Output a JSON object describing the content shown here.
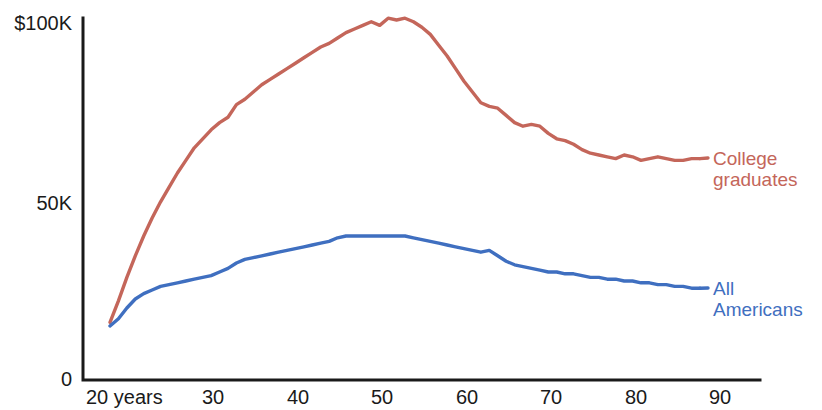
{
  "chart_data": {
    "type": "line",
    "title": "",
    "subtitle": "",
    "xlabel": "",
    "ylabel": "",
    "xlim": [
      20,
      90
    ],
    "ylim": [
      0,
      100000
    ],
    "grid": false,
    "legend_position": "right-inline",
    "x_tick_labels": [
      "20 years",
      "30",
      "40",
      "50",
      "60",
      "70",
      "80",
      "90"
    ],
    "x_tick_values": [
      20,
      30,
      40,
      50,
      60,
      70,
      80,
      90
    ],
    "y_tick_labels": [
      "$100K",
      "50K",
      "0"
    ],
    "y_tick_values": [
      100000,
      50000,
      0
    ],
    "x": [
      20,
      21,
      22,
      23,
      24,
      25,
      26,
      27,
      28,
      29,
      30,
      31,
      32,
      33,
      34,
      35,
      36,
      37,
      38,
      39,
      40,
      41,
      42,
      43,
      44,
      45,
      46,
      47,
      48,
      49,
      50,
      51,
      52,
      53,
      54,
      55,
      56,
      57,
      58,
      59,
      60,
      61,
      62,
      63,
      64,
      65,
      66,
      67,
      68,
      69,
      70,
      71,
      72,
      73,
      74,
      75,
      76,
      77,
      78,
      79,
      80,
      81,
      82,
      83,
      84,
      85,
      86,
      87,
      88,
      89,
      90
    ],
    "series": [
      {
        "name": "College graduates",
        "color": "#c4665a",
        "label_line1": "College",
        "label_line2": "graduates",
        "values": [
          16000,
          22000,
          28500,
          34500,
          40000,
          45000,
          49500,
          53500,
          57500,
          61000,
          64500,
          67000,
          69500,
          71500,
          73000,
          76500,
          78000,
          80000,
          82000,
          83500,
          85000,
          86500,
          88000,
          89500,
          91000,
          92500,
          93500,
          95000,
          96500,
          97500,
          98500,
          99500,
          98500,
          100500,
          100000,
          100500,
          99500,
          98000,
          96000,
          93000,
          90000,
          86500,
          83000,
          80000,
          77000,
          76000,
          75500,
          73500,
          71500,
          70500,
          71000,
          70500,
          68500,
          67000,
          66500,
          65500,
          64000,
          63000,
          62500,
          62000,
          61500,
          62500,
          62000,
          61000,
          61500,
          62000,
          61500,
          61000,
          61000,
          61500,
          61500
        ]
      },
      {
        "name": "All Americans",
        "color": "#3f6fc0",
        "label_line1": "All",
        "label_line2": "Americans",
        "values": [
          15000,
          17000,
          20000,
          22500,
          24000,
          25000,
          26000,
          26500,
          27000,
          27500,
          28000,
          28500,
          29000,
          30000,
          31000,
          32500,
          33500,
          34000,
          34500,
          35000,
          35500,
          36000,
          36500,
          37000,
          37500,
          38000,
          38500,
          39500,
          40000,
          40000,
          40000,
          40000,
          40000,
          40000,
          40000,
          40000,
          39500,
          39000,
          38500,
          38000,
          37500,
          37000,
          36500,
          36000,
          35500,
          36000,
          34500,
          33000,
          32000,
          31500,
          31000,
          30500,
          30000,
          30000,
          29500,
          29500,
          29000,
          28500,
          28500,
          28000,
          28000,
          27500,
          27500,
          27000,
          27000,
          26500,
          26500,
          26000,
          26000,
          25500,
          25500
        ]
      }
    ]
  },
  "axes": {
    "y_labels": [
      {
        "text": "$100K"
      },
      {
        "text": "50K"
      },
      {
        "text": "0"
      }
    ],
    "x_labels": [
      {
        "text": "20 years"
      },
      {
        "text": "30"
      },
      {
        "text": "40"
      },
      {
        "text": "50"
      },
      {
        "text": "60"
      },
      {
        "text": "70"
      },
      {
        "text": "80"
      },
      {
        "text": "90"
      }
    ]
  }
}
